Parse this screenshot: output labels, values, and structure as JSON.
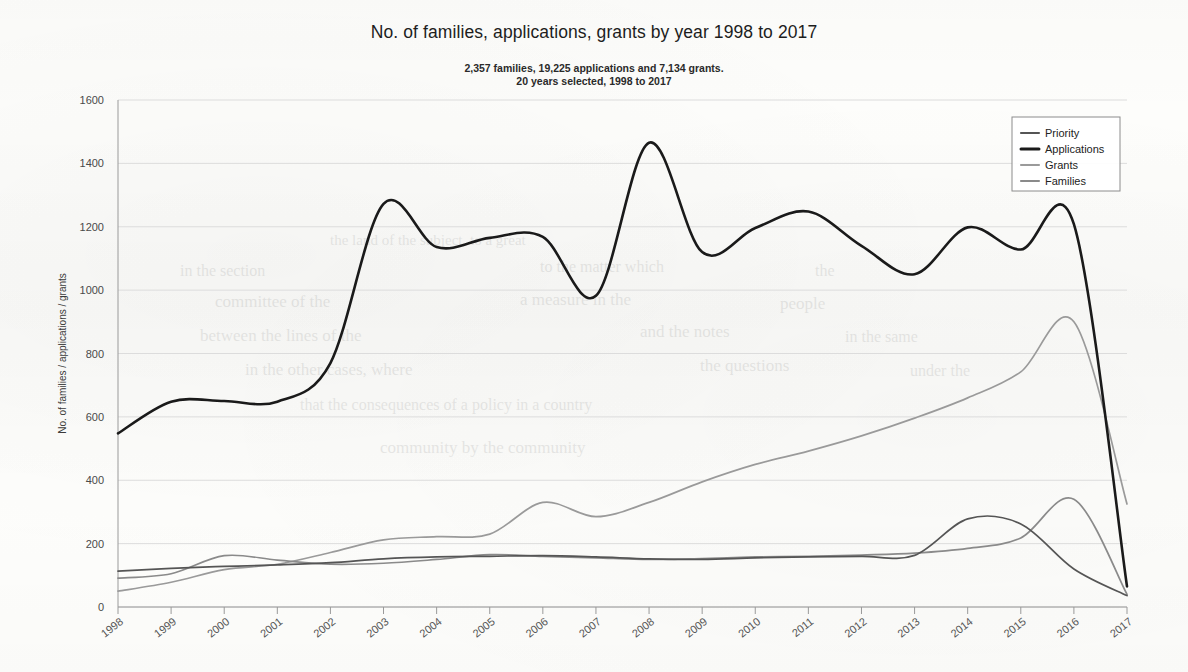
{
  "chart_data": {
    "type": "line",
    "title": "No. of families, applications, grants by year 1998 to 2017",
    "subtitle_line1": "2,357 families, 19,225 applications and 7,134 grants.",
    "subtitle_line2": "20 years selected, 1998 to 2017",
    "xlabel": "",
    "ylabel": "No. of families / applications / grants",
    "categories": [
      "1998",
      "1999",
      "2000",
      "2001",
      "2002",
      "2003",
      "2004",
      "2005",
      "2006",
      "2007",
      "2008",
      "2009",
      "2010",
      "2011",
      "2012",
      "2013",
      "2014",
      "2015",
      "2016",
      "2017"
    ],
    "x": [
      1998,
      1999,
      2000,
      2001,
      2002,
      2003,
      2004,
      2005,
      2006,
      2007,
      2008,
      2009,
      2010,
      2011,
      2012,
      2013,
      2014,
      2015,
      2016,
      2017
    ],
    "ylim": [
      0,
      1600
    ],
    "yticks": [
      0,
      200,
      400,
      600,
      800,
      1000,
      1200,
      1400,
      1600
    ],
    "grid": true,
    "legend_position": "top-right",
    "series": [
      {
        "name": "Priority",
        "color": "#555555",
        "width": 1.7,
        "values": [
          113,
          122,
          128,
          133,
          140,
          152,
          158,
          160,
          162,
          158,
          152,
          150,
          155,
          158,
          160,
          163,
          278,
          262,
          120,
          36
        ]
      },
      {
        "name": "Applications",
        "color": "#1a1a1a",
        "width": 2.6,
        "values": [
          548,
          648,
          650,
          648,
          770,
          1272,
          1136,
          1165,
          1168,
          982,
          1465,
          1120,
          1196,
          1248,
          1140,
          1050,
          1198,
          1128,
          1208,
          65
        ]
      },
      {
        "name": "Grants",
        "color": "#9a9a9a",
        "width": 1.7,
        "values": [
          50,
          78,
          118,
          135,
          172,
          212,
          222,
          230,
          330,
          285,
          330,
          395,
          450,
          492,
          540,
          596,
          660,
          742,
          900,
          325
        ]
      },
      {
        "name": "Families",
        "color": "#8a8a8a",
        "width": 1.7,
        "values": [
          91,
          105,
          162,
          148,
          135,
          138,
          150,
          165,
          160,
          155,
          150,
          153,
          158,
          160,
          164,
          170,
          185,
          218,
          340,
          40
        ]
      }
    ]
  },
  "ghost_text": [
    {
      "t": "the land of the subject, to a great",
      "x": 330,
      "y": 232,
      "s": 15
    },
    {
      "t": "in the section",
      "x": 180,
      "y": 262,
      "s": 16
    },
    {
      "t": "to the matter which",
      "x": 540,
      "y": 258,
      "s": 16
    },
    {
      "t": "the",
      "x": 815,
      "y": 262,
      "s": 16
    },
    {
      "t": "committee of the",
      "x": 215,
      "y": 292,
      "s": 17
    },
    {
      "t": "a measure in the",
      "x": 520,
      "y": 290,
      "s": 17
    },
    {
      "t": "people",
      "x": 780,
      "y": 294,
      "s": 17
    },
    {
      "t": "between the lines of the",
      "x": 200,
      "y": 326,
      "s": 17
    },
    {
      "t": "and the notes",
      "x": 640,
      "y": 322,
      "s": 17
    },
    {
      "t": "in the same",
      "x": 845,
      "y": 328,
      "s": 16
    },
    {
      "t": "in the other cases, where",
      "x": 245,
      "y": 360,
      "s": 17
    },
    {
      "t": "the questions",
      "x": 700,
      "y": 356,
      "s": 17
    },
    {
      "t": "under the",
      "x": 910,
      "y": 362,
      "s": 16
    },
    {
      "t": "that the consequences of a policy in a country",
      "x": 300,
      "y": 396,
      "s": 16
    },
    {
      "t": "community by the community",
      "x": 380,
      "y": 438,
      "s": 17
    }
  ]
}
